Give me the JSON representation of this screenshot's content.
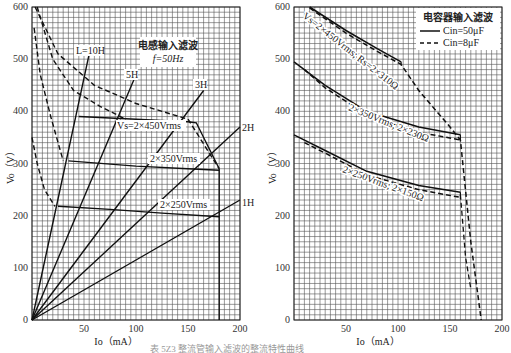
{
  "chart_data": [
    {
      "type": "line",
      "title": "电感输入滤波",
      "subtitle": "f=50Hz",
      "xlabel": "Io（mA）",
      "ylabel": "Vo（V）",
      "xlim": [
        0,
        200
      ],
      "ylim": [
        0,
        600
      ],
      "x_ticks": [
        0,
        50,
        100,
        150,
        200
      ],
      "y_ticks": [
        0,
        100,
        200,
        300,
        400,
        500,
        600
      ],
      "grid": true,
      "load_lines": [
        {
          "name": "L=10H",
          "points": [
            [
              0,
              0
            ],
            [
              55,
              510
            ]
          ]
        },
        {
          "name": "5H",
          "points": [
            [
              0,
              0
            ],
            [
              100,
              470
            ]
          ]
        },
        {
          "name": "3H",
          "points": [
            [
              0,
              0
            ],
            [
              165,
              440
            ]
          ]
        },
        {
          "name": "2H",
          "points": [
            [
              0,
              0
            ],
            [
              200,
              370
            ]
          ]
        },
        {
          "name": "1H",
          "points": [
            [
              0,
              0
            ],
            [
              200,
              230
            ]
          ]
        }
      ],
      "regulation_curves": [
        {
          "name": "Vs=2×450Vrms",
          "points": [
            [
              45,
              390
            ],
            [
              100,
              385
            ],
            [
              150,
              380
            ],
            [
              158,
              378
            ],
            [
              180,
              290
            ]
          ]
        },
        {
          "name": "2×350Vrms",
          "points": [
            [
              35,
              305
            ],
            [
              100,
              295
            ],
            [
              150,
              290
            ],
            [
              180,
              287
            ]
          ]
        },
        {
          "name": "2×250Vrms",
          "points": [
            [
              25,
              218
            ],
            [
              75,
              212
            ],
            [
              125,
              205
            ],
            [
              180,
              198
            ]
          ]
        }
      ],
      "critical_curves_dashed": [
        {
          "name": "critical-450",
          "points": [
            [
              3,
              600
            ],
            [
              25,
              510
            ],
            [
              60,
              450
            ],
            [
              100,
              415
            ],
            [
              150,
              385
            ],
            [
              180,
              290
            ]
          ]
        },
        {
          "name": "critical-350",
          "points": [
            [
              5,
              600
            ],
            [
              20,
              500
            ],
            [
              40,
              440
            ],
            [
              65,
              410
            ],
            [
              90,
              385
            ]
          ]
        },
        {
          "name": "critical-250a",
          "points": [
            [
              2,
              560
            ],
            [
              8,
              470
            ],
            [
              18,
              390
            ],
            [
              30,
              305
            ]
          ]
        },
        {
          "name": "critical-250b",
          "points": [
            [
              0,
              350
            ],
            [
              5,
              300
            ],
            [
              12,
              250
            ],
            [
              22,
              218
            ]
          ]
        }
      ],
      "vertical_limit_mA": 180
    },
    {
      "type": "line",
      "title": "电容器输入滤波",
      "xlabel": "Io（mA）",
      "ylabel": "Vo（V）",
      "xlim": [
        0,
        200
      ],
      "ylim": [
        0,
        600
      ],
      "x_ticks": [
        0,
        50,
        100,
        150,
        200
      ],
      "y_ticks": [
        0,
        100,
        200,
        300,
        400,
        500,
        600
      ],
      "grid": true,
      "legend": [
        {
          "label": "Cin=50μF",
          "style": "solid"
        },
        {
          "label": "Cin=8μF",
          "style": "dashed"
        }
      ],
      "legend_position": "top-right",
      "series": [
        {
          "name": "Vs=2×450Vrms; Rs=2×310Ω (50μF)",
          "style": "solid",
          "points": [
            [
              15,
              600
            ],
            [
              50,
              555
            ],
            [
              80,
              520
            ],
            [
              103,
              495
            ]
          ]
        },
        {
          "name": "Vs=2×450Vrms; Rs=2×310Ω (8μF)",
          "style": "dashed",
          "points": [
            [
              15,
              598
            ],
            [
              50,
              550
            ],
            [
              80,
              515
            ],
            [
              103,
              490
            ],
            [
              120,
              440
            ],
            [
              150,
              370
            ],
            [
              160,
              345
            ],
            [
              170,
              150
            ],
            [
              180,
              0
            ]
          ]
        },
        {
          "name": "2×350Vrms; 2×230Ω (50μF)",
          "style": "solid",
          "points": [
            [
              0,
              495
            ],
            [
              30,
              450
            ],
            [
              70,
              400
            ],
            [
              120,
              370
            ],
            [
              160,
              355
            ]
          ]
        },
        {
          "name": "2×350Vrms; 2×230Ω (8μF)",
          "style": "dashed",
          "points": [
            [
              10,
              480
            ],
            [
              30,
              445
            ],
            [
              70,
              393
            ],
            [
              120,
              360
            ],
            [
              160,
              345
            ]
          ]
        },
        {
          "name": "2×250Vrms; 2×150Ω (50μF)",
          "style": "solid",
          "points": [
            [
              0,
              355
            ],
            [
              30,
              325
            ],
            [
              70,
              285
            ],
            [
              120,
              258
            ],
            [
              160,
              245
            ]
          ]
        },
        {
          "name": "2×250Vrms; 2×150Ω (8μF)",
          "style": "dashed",
          "points": [
            [
              10,
              340
            ],
            [
              30,
              320
            ],
            [
              70,
              278
            ],
            [
              120,
              250
            ],
            [
              160,
              235
            ]
          ]
        }
      ],
      "cutoff": {
        "style": "dashed",
        "points": [
          [
            160,
            345
          ],
          [
            170,
            150
          ],
          [
            180,
            0
          ]
        ]
      }
    }
  ],
  "labels": {
    "left": {
      "box_title": "电感输入滤波",
      "box_sub": "f=50Hz",
      "L10": "L=10H",
      "L5": "5H",
      "L3": "3H",
      "L2": "2H",
      "L1": "1H",
      "v450": "Vs=2×450Vrms",
      "v350": "2×350Vrms",
      "v250": "2×250Vrms",
      "xlabel": "Io（mA）",
      "ylabel": "Vo（V）"
    },
    "right": {
      "legend_title": "电容器输入滤波",
      "legend_solid": "Cin=50μF",
      "legend_dashed": "Cin=8μF",
      "c450": "Vs=2×450Vrms; Rs=2×310Ω",
      "c350": "2×350Vrms; 2×230Ω",
      "c250": "2×250Vrms; 2×150Ω",
      "xlabel": "Io（mA）",
      "ylabel": "Vo（V）"
    },
    "y_ticks": [
      "0",
      "100",
      "200",
      "300",
      "400",
      "500",
      "600"
    ],
    "x_ticks": [
      "50",
      "100",
      "150",
      "200"
    ]
  },
  "caption": "表 5Z3 整流管输入滤波的整流特性曲线"
}
